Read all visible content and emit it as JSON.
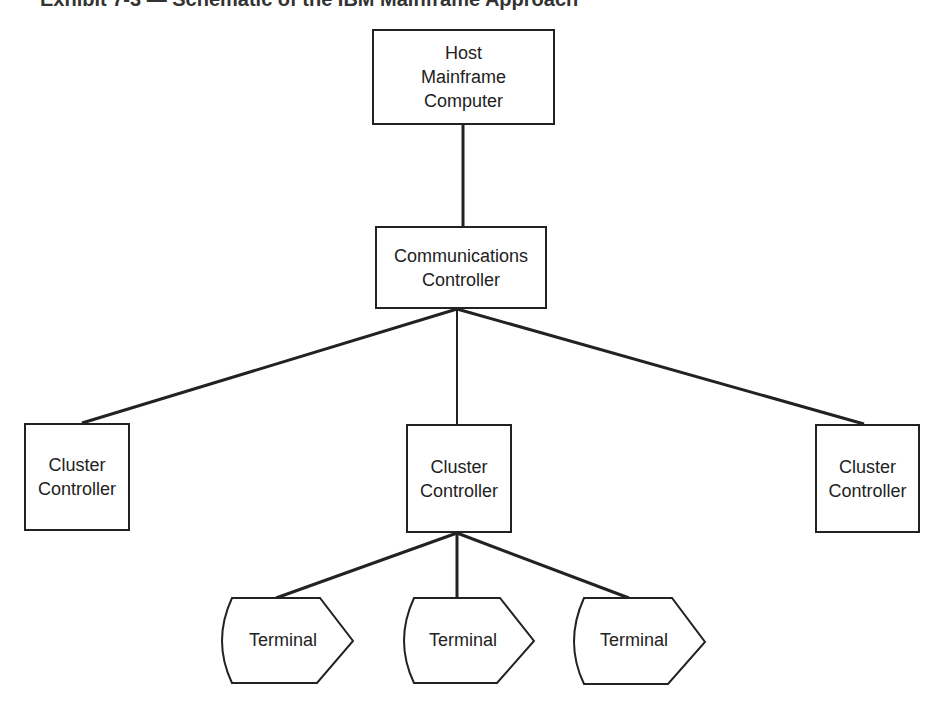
{
  "title": "Exhibit 7-3 — Schematic of the IBM Mainframe Approach",
  "nodes": {
    "host": {
      "line1": "Host",
      "line2": "Mainframe",
      "line3": "Computer"
    },
    "comm": {
      "line1": "Communications",
      "line2": "Controller"
    },
    "cluster_left": {
      "line1": "Cluster",
      "line2": "Controller"
    },
    "cluster_mid": {
      "line1": "Cluster",
      "line2": "Controller"
    },
    "cluster_right": {
      "line1": "Cluster",
      "line2": "Controller"
    },
    "terminals": [
      {
        "label": "Terminal"
      },
      {
        "label": "Terminal"
      },
      {
        "label": "Terminal"
      }
    ]
  }
}
